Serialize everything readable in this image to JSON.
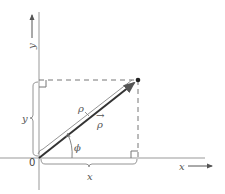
{
  "diagram": {
    "type": "polar-cartesian-coordinates",
    "colors": {
      "line": "#888888",
      "vector": "#333333",
      "text": "#555555"
    },
    "axes": {
      "x_label": "x",
      "y_label": "y",
      "origin_label": "0"
    },
    "point": {
      "x": 138,
      "y": 80
    },
    "labels": {
      "rho_magnitude": "ρ",
      "rho_vector": "ρ",
      "rho_vector_arrow": "→",
      "phi": "ϕ",
      "x_component": "x",
      "y_component": "y"
    }
  }
}
